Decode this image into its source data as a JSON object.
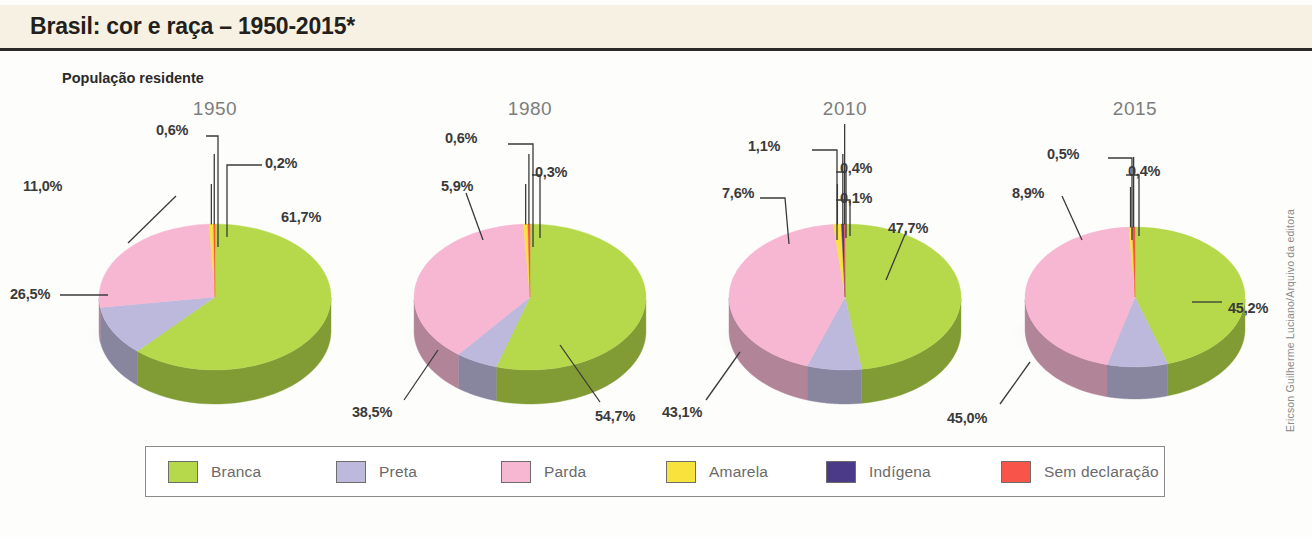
{
  "header": {
    "title": "Brasil: cor e raça – 1950-2015*",
    "subtitle": "População residente"
  },
  "credit": "Ericson Guilherme Luciano/Arquivo da editora",
  "legend": {
    "items": [
      {
        "label": "Branca",
        "color": "#b5d94a"
      },
      {
        "label": "Preta",
        "color": "#bdb9dd"
      },
      {
        "label": "Parda",
        "color": "#f7b7d2"
      },
      {
        "label": "Amarela",
        "color": "#f7e33c"
      },
      {
        "label": "Indígena",
        "color": "#4b3a87"
      },
      {
        "label": "Sem declaração",
        "color": "#f9544a"
      }
    ]
  },
  "chart_data": {
    "type": "pie",
    "title": "Brasil: cor e raça – 1950-2015*",
    "subtitle": "População residente",
    "unit": "%",
    "categories": [
      "Branca",
      "Preta",
      "Parda",
      "Amarela",
      "Indígena",
      "Sem declaração"
    ],
    "colors": [
      "#b5d94a",
      "#bdb9dd",
      "#f7b7d2",
      "#f7e33c",
      "#4b3a87",
      "#f9544a"
    ],
    "legend_position": "bottom",
    "charts": [
      {
        "year": "1950",
        "slices": [
          {
            "category": "Branca",
            "value": 61.7,
            "label": "61,7%"
          },
          {
            "category": "Preta",
            "value": 11.0,
            "label": "11,0%"
          },
          {
            "category": "Parda",
            "value": 26.5,
            "label": "26,5%"
          },
          {
            "category": "Amarela",
            "value": 0.6,
            "label": "0,6%"
          },
          {
            "category": "Sem declaração",
            "value": 0.2,
            "label": "0,2%"
          }
        ]
      },
      {
        "year": "1980",
        "slices": [
          {
            "category": "Branca",
            "value": 54.7,
            "label": "54,7%"
          },
          {
            "category": "Preta",
            "value": 5.9,
            "label": "5,9%"
          },
          {
            "category": "Parda",
            "value": 38.5,
            "label": "38,5%"
          },
          {
            "category": "Amarela",
            "value": 0.6,
            "label": "0,6%"
          },
          {
            "category": "Sem declaração",
            "value": 0.3,
            "label": "0,3%"
          }
        ]
      },
      {
        "year": "2010",
        "slices": [
          {
            "category": "Branca",
            "value": 47.7,
            "label": "47,7%"
          },
          {
            "category": "Preta",
            "value": 7.6,
            "label": "7,6%"
          },
          {
            "category": "Parda",
            "value": 43.1,
            "label": "43,1%"
          },
          {
            "category": "Amarela",
            "value": 1.1,
            "label": "1,1%"
          },
          {
            "category": "Indígena",
            "value": 0.4,
            "label": "0,4%"
          },
          {
            "category": "Sem declaração",
            "value": 0.1,
            "label": "0,1%"
          }
        ]
      },
      {
        "year": "2015",
        "slices": [
          {
            "category": "Branca",
            "value": 45.2,
            "label": "45,2%"
          },
          {
            "category": "Preta",
            "value": 8.9,
            "label": "8,9%"
          },
          {
            "category": "Parda",
            "value": 45.0,
            "label": "45,0%"
          },
          {
            "category": "Amarela",
            "value": 0.5,
            "label": "0,5%"
          },
          {
            "category": "Sem declaração",
            "value": 0.4,
            "label": "0,4%"
          }
        ]
      }
    ]
  },
  "pie_layout": [
    {
      "cx": 215,
      "cy": 297,
      "rx": 116,
      "ry": 73,
      "depth": 34,
      "year_left": 145,
      "labels": [
        {
          "text_bind": 0,
          "x": 240,
          "y": 216,
          "anchor": "start"
        },
        {
          "text_bind": 1,
          "x": 10,
          "y": 290,
          "anchor": "start"
        },
        {
          "text_bind": 2,
          "x": 25,
          "y": 185,
          "anchor": "start"
        },
        {
          "text_bind": 3,
          "x": 145,
          "y": 128,
          "anchor": "start"
        },
        {
          "text_bind": 4,
          "x": 228,
          "y": 160,
          "anchor": "start"
        }
      ]
    },
    {
      "cx": 530,
      "cy": 297,
      "rx": 116,
      "ry": 73,
      "depth": 34,
      "year_left": 460
    },
    {
      "cx": 845,
      "cy": 297,
      "rx": 116,
      "ry": 73,
      "depth": 34,
      "year_left": 775
    },
    {
      "cx": 1135,
      "cy": 297,
      "rx": 110,
      "ry": 70,
      "depth": 32,
      "year_left": 1065
    }
  ],
  "callouts": {
    "p1950": [
      {
        "name": "label-1950-branca",
        "text": "61,7%",
        "left": 281,
        "top": 209
      },
      {
        "name": "label-1950-preta",
        "text": "11,0%",
        "left": 23,
        "top": 178
      },
      {
        "name": "label-1950-parda",
        "text": "26,5%",
        "left": 10,
        "top": 286
      },
      {
        "name": "label-1950-amarela",
        "text": "0,6%",
        "left": 156,
        "top": 122
      },
      {
        "name": "label-1950-sem",
        "text": "0,2%",
        "left": 265,
        "top": 155
      }
    ],
    "p1980": [
      {
        "name": "label-1980-branca",
        "text": "54,7%",
        "left": 595,
        "top": 408
      },
      {
        "name": "label-1980-preta",
        "text": "5,9%",
        "left": 441,
        "top": 178
      },
      {
        "name": "label-1980-parda",
        "text": "38,5%",
        "left": 352,
        "top": 404
      },
      {
        "name": "label-1980-amarela",
        "text": "0,6%",
        "left": 445,
        "top": 130
      },
      {
        "name": "label-1980-sem",
        "text": "0,3%",
        "left": 535,
        "top": 164
      }
    ],
    "p2010": [
      {
        "name": "label-2010-branca",
        "text": "47,7%",
        "left": 888,
        "top": 220
      },
      {
        "name": "label-2010-preta",
        "text": "7,6%",
        "left": 722,
        "top": 185
      },
      {
        "name": "label-2010-parda",
        "text": "43,1%",
        "left": 662,
        "top": 404
      },
      {
        "name": "label-2010-amarela",
        "text": "1,1%",
        "left": 748,
        "top": 138
      },
      {
        "name": "label-2010-indigena",
        "text": "0,4%",
        "left": 840,
        "top": 160
      },
      {
        "name": "label-2010-sem",
        "text": "0,1%",
        "left": 840,
        "top": 190
      }
    ],
    "p2015": [
      {
        "name": "label-2015-branca",
        "text": "45,2%",
        "left": 1228,
        "top": 300
      },
      {
        "name": "label-2015-preta",
        "text": "8,9%",
        "left": 1012,
        "top": 185
      },
      {
        "name": "label-2015-parda",
        "text": "45,0%",
        "left": 947,
        "top": 410
      },
      {
        "name": "label-2015-amarela",
        "text": "0,5%",
        "left": 1047,
        "top": 146
      },
      {
        "name": "label-2015-sem",
        "text": "0,4%",
        "left": 1128,
        "top": 163
      }
    ]
  }
}
